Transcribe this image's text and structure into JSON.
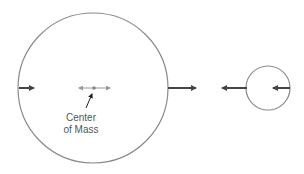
{
  "diagram": {
    "label": {
      "line1": "Center",
      "line2": "of Mass"
    },
    "colors": {
      "circle": "#8a8a8a",
      "arrow": "#444444",
      "com_arrow": "#999999"
    },
    "big_circle": {
      "cx": 93,
      "cy": 88,
      "r": 75
    },
    "small_circle": {
      "cx": 268,
      "cy": 88,
      "r": 22
    }
  }
}
